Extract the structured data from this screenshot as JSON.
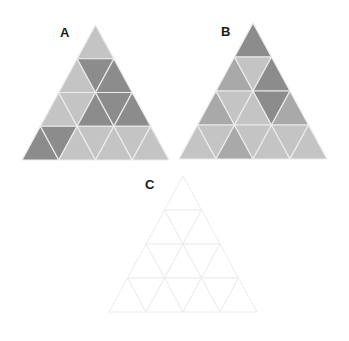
{
  "palette": {
    "dark": "#8c8c8c",
    "medium": "#a9a9a9",
    "light": "#c4c4c4",
    "blank": "#ffffff",
    "edge_filled": "#ececec",
    "edge_blank": "#ececec"
  },
  "puzzles": [
    {
      "id": "A",
      "label": "A",
      "label_pos": [
        60,
        26
      ],
      "apex": [
        95.5,
        25
      ],
      "base_left": [
        22,
        160
      ],
      "base_right": [
        169,
        160
      ],
      "rows": [
        [
          "light"
        ],
        [
          "light",
          "dark",
          "dark"
        ],
        [
          "light",
          "light",
          "dark",
          "dark",
          "dark"
        ],
        [
          "dark",
          "dark",
          "light",
          "light",
          "light",
          "light",
          "light"
        ]
      ]
    },
    {
      "id": "B",
      "label": "B",
      "label_pos": [
        221,
        25
      ],
      "apex": [
        253,
        23
      ],
      "base_left": [
        179,
        159
      ],
      "base_right": [
        327,
        159
      ],
      "rows": [
        [
          "dark"
        ],
        [
          "medium",
          "light",
          "dark"
        ],
        [
          "medium",
          "light",
          "light",
          "dark",
          "medium"
        ],
        [
          "light",
          "light",
          "medium",
          "light",
          "light",
          "light",
          "light"
        ]
      ]
    },
    {
      "id": "C",
      "label": "C",
      "label_pos": [
        145,
        178
      ],
      "apex": [
        183,
        176
      ],
      "base_left": [
        109,
        312
      ],
      "base_right": [
        257,
        312
      ],
      "rows": [
        [
          "blank"
        ],
        [
          "blank",
          "blank",
          "blank"
        ],
        [
          "blank",
          "blank",
          "blank",
          "blank",
          "blank"
        ],
        [
          "blank",
          "blank",
          "blank",
          "blank",
          "blank",
          "blank",
          "blank"
        ]
      ]
    }
  ]
}
